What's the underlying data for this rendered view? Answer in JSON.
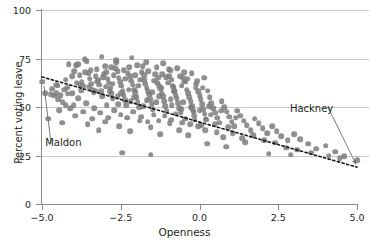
{
  "chart_data": {
    "type": "scatter",
    "title": "",
    "xlabel": "Openness",
    "ylabel": "Percent voting leave",
    "xlim": [
      -5.0,
      5.0
    ],
    "ylim": [
      0,
      100
    ],
    "xticks": [
      -5.0,
      -2.5,
      0.0,
      2.5,
      5.0
    ],
    "xtick_labels": [
      "-5.0",
      "-2.5",
      "0.0",
      "2.5",
      "5.0"
    ],
    "yticks": [
      0,
      25,
      50,
      75,
      100
    ],
    "ytick_labels": [
      "0",
      "25",
      "50",
      "75",
      "100"
    ],
    "grid": "horizontal",
    "legend": "none",
    "point_color": "#7d7d7d",
    "axis_color": "#8a8a8a",
    "grid_color": "#c9c9c9",
    "text_color": "#231f20",
    "trendline": {
      "style": "dotted",
      "color": "#1a1a1a",
      "x": [
        -5.0,
        5.0
      ],
      "y": [
        65.5,
        19.0
      ]
    },
    "annotations": [
      {
        "label": "Maldon",
        "point_x": -5.0,
        "point_y": 63.0,
        "text_x": -4.9,
        "text_y": 32.0
      },
      {
        "label": "Hackney",
        "point_x": 5.0,
        "point_y": 22.5,
        "text_x": 3.95,
        "text_y": 49.0
      }
    ],
    "points": [
      [
        -5.0,
        63.0
      ],
      [
        -4.72,
        56.5
      ],
      [
        -4.62,
        55.8
      ],
      [
        -4.55,
        57.2
      ],
      [
        -4.48,
        54.0
      ],
      [
        -4.4,
        56.0
      ],
      [
        -4.34,
        52.5
      ],
      [
        -4.25,
        51.0
      ],
      [
        -4.18,
        56.8
      ],
      [
        -4.1,
        49.5
      ],
      [
        -4.05,
        66.0
      ],
      [
        -3.98,
        68.5
      ],
      [
        -3.92,
        71.5
      ],
      [
        -3.86,
        72.0
      ],
      [
        -3.8,
        66.5
      ],
      [
        -3.74,
        63.0
      ],
      [
        -3.7,
        61.0
      ],
      [
        -3.62,
        68.0
      ],
      [
        -3.58,
        73.5
      ],
      [
        -3.52,
        67.5
      ],
      [
        -3.48,
        64.5
      ],
      [
        -3.44,
        62.0
      ],
      [
        -3.4,
        59.0
      ],
      [
        -3.36,
        57.5
      ],
      [
        -3.3,
        66.0
      ],
      [
        -3.26,
        69.5
      ],
      [
        -3.22,
        64.0
      ],
      [
        -3.18,
        61.5
      ],
      [
        -3.12,
        58.0
      ],
      [
        -3.08,
        55.5
      ],
      [
        -3.04,
        67.0
      ],
      [
        -3.0,
        71.0
      ],
      [
        -2.96,
        68.0
      ],
      [
        -2.92,
        64.5
      ],
      [
        -2.88,
        62.5
      ],
      [
        -2.84,
        60.0
      ],
      [
        -2.8,
        57.0
      ],
      [
        -2.76,
        54.5
      ],
      [
        -2.72,
        66.5
      ],
      [
        -2.68,
        70.0
      ],
      [
        -2.64,
        73.0
      ],
      [
        -2.6,
        68.5
      ],
      [
        -2.56,
        65.0
      ],
      [
        -2.52,
        63.0
      ],
      [
        -2.48,
        61.0
      ],
      [
        -2.44,
        58.5
      ],
      [
        -2.4,
        56.0
      ],
      [
        -2.36,
        53.5
      ],
      [
        -2.32,
        51.0
      ],
      [
        -2.28,
        67.5
      ],
      [
        -2.24,
        70.5
      ],
      [
        -2.2,
        66.0
      ],
      [
        -2.16,
        63.5
      ],
      [
        -2.12,
        61.5
      ],
      [
        -2.08,
        59.0
      ],
      [
        -2.04,
        57.5
      ],
      [
        -2.0,
        55.0
      ],
      [
        -1.96,
        52.5
      ],
      [
        -1.92,
        50.0
      ],
      [
        -1.88,
        64.0
      ],
      [
        -1.84,
        68.0
      ],
      [
        -1.8,
        71.0
      ],
      [
        -1.76,
        66.5
      ],
      [
        -1.72,
        62.0
      ],
      [
        -1.68,
        60.0
      ],
      [
        -1.64,
        58.0
      ],
      [
        -1.6,
        56.5
      ],
      [
        -1.56,
        54.0
      ],
      [
        -1.52,
        51.5
      ],
      [
        -1.48,
        49.0
      ],
      [
        -1.44,
        63.5
      ],
      [
        -1.4,
        67.0
      ],
      [
        -1.36,
        70.5
      ],
      [
        -1.32,
        65.0
      ],
      [
        -1.28,
        61.0
      ],
      [
        -1.24,
        59.5
      ],
      [
        -1.2,
        57.0
      ],
      [
        -1.16,
        55.5
      ],
      [
        -1.12,
        53.0
      ],
      [
        -1.08,
        50.5
      ],
      [
        -1.04,
        48.0
      ],
      [
        -1.0,
        62.5
      ],
      [
        -0.96,
        66.0
      ],
      [
        -0.92,
        69.0
      ],
      [
        -0.88,
        64.0
      ],
      [
        -0.84,
        60.5
      ],
      [
        -0.8,
        58.0
      ],
      [
        -0.76,
        56.0
      ],
      [
        -0.72,
        54.5
      ],
      [
        -0.68,
        52.0
      ],
      [
        -0.64,
        49.5
      ],
      [
        -0.6,
        47.0
      ],
      [
        -0.56,
        61.0
      ],
      [
        -0.52,
        65.0
      ],
      [
        -0.48,
        68.0
      ],
      [
        -0.44,
        63.0
      ],
      [
        -0.4,
        59.0
      ],
      [
        -0.36,
        57.0
      ],
      [
        -0.32,
        55.0
      ],
      [
        -0.28,
        53.0
      ],
      [
        -0.24,
        50.5
      ],
      [
        -0.2,
        48.0
      ],
      [
        -0.16,
        45.5
      ],
      [
        -0.12,
        60.0
      ],
      [
        -0.08,
        63.5
      ],
      [
        -0.04,
        58.0
      ],
      [
        0.0,
        56.0
      ],
      [
        0.04,
        54.0
      ],
      [
        0.08,
        51.5
      ],
      [
        0.12,
        49.0
      ],
      [
        0.16,
        46.5
      ],
      [
        0.2,
        44.0
      ],
      [
        0.26,
        58.5
      ],
      [
        0.32,
        55.0
      ],
      [
        0.38,
        52.0
      ],
      [
        0.44,
        49.5
      ],
      [
        0.5,
        47.0
      ],
      [
        0.56,
        44.5
      ],
      [
        0.62,
        42.0
      ],
      [
        0.7,
        53.0
      ],
      [
        0.78,
        50.0
      ],
      [
        0.86,
        47.5
      ],
      [
        0.94,
        45.0
      ],
      [
        1.02,
        42.5
      ],
      [
        1.1,
        40.0
      ],
      [
        1.2,
        48.0
      ],
      [
        1.3,
        45.5
      ],
      [
        1.4,
        43.0
      ],
      [
        1.5,
        40.5
      ],
      [
        1.62,
        38.0
      ],
      [
        1.75,
        44.0
      ],
      [
        1.88,
        41.5
      ],
      [
        2.0,
        39.0
      ],
      [
        2.15,
        36.5
      ],
      [
        2.3,
        40.0
      ],
      [
        2.45,
        37.5
      ],
      [
        2.6,
        35.0
      ],
      [
        2.8,
        33.0
      ],
      [
        3.0,
        36.0
      ],
      [
        3.2,
        33.5
      ],
      [
        3.45,
        31.0
      ],
      [
        3.7,
        28.5
      ],
      [
        4.0,
        30.0
      ],
      [
        4.3,
        27.0
      ],
      [
        4.6,
        24.5
      ],
      [
        5.0,
        22.5
      ],
      [
        -4.8,
        44.0
      ],
      [
        -4.35,
        42.0
      ],
      [
        -3.95,
        45.5
      ],
      [
        -3.55,
        41.0
      ],
      [
        -3.2,
        38.0
      ],
      [
        -2.9,
        44.5
      ],
      [
        -2.55,
        40.0
      ],
      [
        -2.2,
        37.5
      ],
      [
        -1.9,
        43.0
      ],
      [
        -1.55,
        39.5
      ],
      [
        -1.25,
        36.0
      ],
      [
        -0.95,
        41.5
      ],
      [
        -0.65,
        38.0
      ],
      [
        -0.35,
        35.5
      ],
      [
        -0.05,
        40.0
      ],
      [
        -2.45,
        26.5
      ],
      [
        -1.55,
        25.5
      ],
      [
        0.25,
        31.0
      ],
      [
        0.85,
        29.5
      ],
      [
        1.45,
        32.0
      ],
      [
        -4.15,
        72.0
      ],
      [
        -3.65,
        74.5
      ],
      [
        -3.1,
        76.0
      ],
      [
        -2.65,
        74.0
      ],
      [
        -2.15,
        75.5
      ],
      [
        -1.7,
        73.0
      ],
      [
        -1.15,
        72.5
      ],
      [
        -0.7,
        70.0
      ],
      [
        -0.25,
        67.5
      ],
      [
        0.15,
        65.0
      ],
      [
        -4.55,
        61.5
      ],
      [
        -4.3,
        59.0
      ],
      [
        -4.05,
        57.0
      ],
      [
        -3.85,
        54.5
      ],
      [
        -3.6,
        52.0
      ],
      [
        -3.35,
        49.5
      ],
      [
        -3.15,
        47.0
      ],
      [
        -2.95,
        51.0
      ],
      [
        -2.7,
        48.5
      ],
      [
        -2.5,
        46.0
      ],
      [
        -2.3,
        44.5
      ],
      [
        -2.1,
        47.5
      ],
      [
        -1.85,
        45.0
      ],
      [
        -1.65,
        42.5
      ],
      [
        -1.45,
        46.0
      ],
      [
        -1.3,
        43.0
      ],
      [
        -1.1,
        45.5
      ],
      [
        -0.9,
        43.5
      ],
      [
        -0.75,
        46.5
      ],
      [
        -0.55,
        42.0
      ],
      [
        -0.45,
        44.0
      ],
      [
        -0.3,
        41.0
      ],
      [
        -0.15,
        43.5
      ],
      [
        0.05,
        40.5
      ],
      [
        0.18,
        38.0
      ],
      [
        -3.45,
        69.0
      ],
      [
        -3.05,
        65.5
      ],
      [
        -2.75,
        62.0
      ],
      [
        -2.35,
        64.5
      ],
      [
        -2.05,
        66.5
      ],
      [
        -1.75,
        64.0
      ],
      [
        -1.35,
        62.5
      ],
      [
        -1.05,
        65.5
      ],
      [
        -0.85,
        61.0
      ],
      [
        -0.5,
        63.0
      ],
      [
        -4.9,
        57.0
      ],
      [
        -4.68,
        59.5
      ],
      [
        -4.5,
        61.0
      ],
      [
        -4.2,
        60.0
      ],
      [
        -3.9,
        62.5
      ],
      [
        -3.75,
        58.5
      ],
      [
        -3.5,
        60.5
      ],
      [
        -3.25,
        63.0
      ],
      [
        -2.85,
        58.0
      ],
      [
        -2.6,
        55.5
      ],
      [
        -2.25,
        59.0
      ],
      [
        -1.95,
        61.0
      ],
      [
        -1.5,
        57.5
      ],
      [
        -1.2,
        60.0
      ],
      [
        -0.8,
        58.5
      ],
      [
        0.35,
        46.0
      ],
      [
        0.55,
        37.0
      ],
      [
        0.75,
        34.5
      ],
      [
        1.05,
        36.5
      ],
      [
        1.35,
        34.0
      ],
      [
        1.7,
        35.5
      ],
      [
        2.05,
        33.0
      ],
      [
        2.4,
        31.5
      ],
      [
        2.75,
        29.0
      ],
      [
        3.1,
        28.0
      ],
      [
        3.55,
        26.5
      ],
      [
        4.1,
        25.0
      ],
      [
        4.45,
        23.5
      ],
      [
        2.2,
        26.0
      ],
      [
        2.9,
        25.5
      ],
      [
        -2.8,
        70.5
      ],
      [
        -2.4,
        69.0
      ],
      [
        -1.98,
        71.5
      ],
      [
        -1.62,
        68.5
      ],
      [
        -1.18,
        67.0
      ],
      [
        -0.98,
        69.5
      ],
      [
        -0.62,
        66.0
      ],
      [
        -0.38,
        64.5
      ],
      [
        -0.1,
        62.0
      ],
      [
        0.1,
        60.0
      ],
      [
        -4.45,
        48.5
      ],
      [
        -4.0,
        51.0
      ],
      [
        -3.7,
        47.5
      ],
      [
        -3.4,
        44.0
      ],
      [
        -3.0,
        42.5
      ],
      [
        -2.58,
        51.5
      ],
      [
        -2.18,
        53.0
      ],
      [
        -1.78,
        50.5
      ],
      [
        -1.38,
        52.5
      ],
      [
        -0.88,
        51.0
      ],
      [
        -0.58,
        49.0
      ],
      [
        -0.18,
        47.5
      ],
      [
        0.22,
        43.5
      ],
      [
        0.48,
        41.0
      ],
      [
        0.92,
        39.5
      ],
      [
        -4.25,
        64.0
      ],
      [
        -3.8,
        61.5
      ],
      [
        -3.3,
        58.5
      ],
      [
        -2.98,
        60.5
      ],
      [
        -2.48,
        57.0
      ],
      [
        -2.08,
        55.0
      ],
      [
        -1.68,
        53.5
      ],
      [
        -1.28,
        55.5
      ],
      [
        -0.92,
        54.0
      ],
      [
        -0.52,
        52.5
      ],
      [
        -0.28,
        50.0
      ],
      [
        0.0,
        48.5
      ],
      [
        0.3,
        50.5
      ],
      [
        0.68,
        48.0
      ],
      [
        1.15,
        44.5
      ]
    ]
  }
}
